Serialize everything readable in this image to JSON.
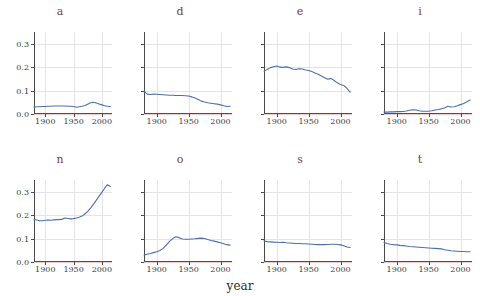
{
  "chart_data": {
    "type": "line",
    "title": "",
    "xlabel": "year",
    "ylabel": "",
    "xlim": [
      1880,
      2018
    ],
    "ylim": [
      0.0,
      0.35
    ],
    "grid": true,
    "legend": false,
    "legend_position": "none",
    "facet_layout": {
      "rows": 2,
      "cols": 4
    },
    "xticks": [
      1900,
      1950,
      2000
    ],
    "xtick_labels": [
      "1900",
      "1950",
      "2000"
    ],
    "yticks": [
      0.0,
      0.1,
      0.2,
      0.3
    ],
    "ytick_labels": [
      "0.0",
      "0.1",
      "0.2",
      "0.3"
    ],
    "line_color": "#4c6fad",
    "baseline_color": "#c0392b",
    "grid_color": "#e3e3ea",
    "title_color": "#7d3b45",
    "panels": [
      {
        "label": "a",
        "row": 0,
        "col": 0,
        "x": [
          1880,
          1885,
          1890,
          1895,
          1900,
          1905,
          1910,
          1915,
          1920,
          1925,
          1930,
          1935,
          1940,
          1945,
          1950,
          1955,
          1960,
          1965,
          1970,
          1975,
          1980,
          1985,
          1990,
          1995,
          2000,
          2005,
          2010,
          2015
        ],
        "y": [
          0.03,
          0.031,
          0.031,
          0.032,
          0.032,
          0.033,
          0.033,
          0.034,
          0.034,
          0.034,
          0.034,
          0.034,
          0.033,
          0.033,
          0.032,
          0.029,
          0.031,
          0.033,
          0.036,
          0.042,
          0.048,
          0.05,
          0.047,
          0.043,
          0.039,
          0.035,
          0.033,
          0.032
        ]
      },
      {
        "label": "d",
        "row": 0,
        "col": 1,
        "x": [
          1880,
          1885,
          1890,
          1895,
          1900,
          1905,
          1910,
          1915,
          1920,
          1925,
          1930,
          1935,
          1940,
          1945,
          1950,
          1955,
          1960,
          1965,
          1970,
          1975,
          1980,
          1985,
          1990,
          1995,
          2000,
          2005,
          2010,
          2015
        ],
        "y": [
          0.098,
          0.085,
          0.083,
          0.085,
          0.084,
          0.083,
          0.082,
          0.081,
          0.08,
          0.08,
          0.079,
          0.079,
          0.079,
          0.078,
          0.077,
          0.073,
          0.068,
          0.062,
          0.055,
          0.051,
          0.048,
          0.046,
          0.044,
          0.042,
          0.039,
          0.035,
          0.032,
          0.033
        ]
      },
      {
        "label": "e",
        "row": 0,
        "col": 2,
        "x": [
          1880,
          1885,
          1890,
          1895,
          1900,
          1905,
          1910,
          1915,
          1920,
          1925,
          1930,
          1935,
          1940,
          1945,
          1950,
          1955,
          1960,
          1965,
          1970,
          1975,
          1980,
          1985,
          1990,
          1995,
          2000,
          2005,
          2010,
          2015
        ],
        "y": [
          0.183,
          0.19,
          0.198,
          0.202,
          0.205,
          0.2,
          0.199,
          0.201,
          0.198,
          0.192,
          0.19,
          0.193,
          0.192,
          0.188,
          0.186,
          0.181,
          0.175,
          0.17,
          0.162,
          0.155,
          0.148,
          0.152,
          0.143,
          0.133,
          0.126,
          0.122,
          0.11,
          0.093
        ]
      },
      {
        "label": "i",
        "row": 0,
        "col": 3,
        "x": [
          1880,
          1885,
          1890,
          1895,
          1900,
          1905,
          1910,
          1915,
          1920,
          1925,
          1930,
          1935,
          1940,
          1945,
          1950,
          1955,
          1960,
          1965,
          1970,
          1975,
          1980,
          1985,
          1990,
          1995,
          2000,
          2005,
          2010,
          2015
        ],
        "y": [
          0.008,
          0.008,
          0.009,
          0.009,
          0.01,
          0.01,
          0.011,
          0.013,
          0.016,
          0.018,
          0.017,
          0.014,
          0.012,
          0.012,
          0.012,
          0.014,
          0.017,
          0.019,
          0.022,
          0.026,
          0.033,
          0.03,
          0.031,
          0.035,
          0.04,
          0.045,
          0.052,
          0.06
        ]
      },
      {
        "label": "n",
        "row": 1,
        "col": 0,
        "x": [
          1880,
          1885,
          1890,
          1895,
          1900,
          1905,
          1910,
          1915,
          1920,
          1925,
          1930,
          1935,
          1940,
          1945,
          1950,
          1955,
          1960,
          1965,
          1970,
          1975,
          1980,
          1985,
          1990,
          1995,
          2000,
          2005,
          2010,
          2015
        ],
        "y": [
          0.181,
          0.179,
          0.176,
          0.176,
          0.178,
          0.179,
          0.178,
          0.18,
          0.181,
          0.181,
          0.183,
          0.188,
          0.186,
          0.184,
          0.185,
          0.188,
          0.191,
          0.196,
          0.205,
          0.216,
          0.23,
          0.246,
          0.263,
          0.28,
          0.297,
          0.315,
          0.33,
          0.322
        ]
      },
      {
        "label": "o",
        "row": 1,
        "col": 1,
        "x": [
          1880,
          1885,
          1890,
          1895,
          1900,
          1905,
          1910,
          1915,
          1920,
          1925,
          1930,
          1935,
          1940,
          1945,
          1950,
          1955,
          1960,
          1965,
          1970,
          1975,
          1980,
          1985,
          1990,
          1995,
          2000,
          2005,
          2010,
          2015
        ],
        "y": [
          0.03,
          0.033,
          0.036,
          0.04,
          0.044,
          0.049,
          0.058,
          0.072,
          0.088,
          0.1,
          0.108,
          0.104,
          0.098,
          0.097,
          0.097,
          0.098,
          0.099,
          0.101,
          0.102,
          0.1,
          0.096,
          0.092,
          0.089,
          0.086,
          0.082,
          0.078,
          0.074,
          0.072
        ]
      },
      {
        "label": "s",
        "row": 1,
        "col": 2,
        "x": [
          1880,
          1885,
          1890,
          1895,
          1900,
          1905,
          1910,
          1915,
          1920,
          1925,
          1930,
          1935,
          1940,
          1945,
          1950,
          1955,
          1960,
          1965,
          1970,
          1975,
          1980,
          1985,
          1990,
          1995,
          2000,
          2005,
          2010,
          2015
        ],
        "y": [
          0.09,
          0.087,
          0.086,
          0.085,
          0.084,
          0.083,
          0.084,
          0.082,
          0.081,
          0.08,
          0.079,
          0.079,
          0.078,
          0.078,
          0.077,
          0.076,
          0.075,
          0.074,
          0.074,
          0.074,
          0.075,
          0.076,
          0.076,
          0.075,
          0.073,
          0.069,
          0.064,
          0.062
        ]
      },
      {
        "label": "t",
        "row": 1,
        "col": 3,
        "x": [
          1880,
          1885,
          1890,
          1895,
          1900,
          1905,
          1910,
          1915,
          1920,
          1925,
          1930,
          1935,
          1940,
          1945,
          1950,
          1955,
          1960,
          1965,
          1970,
          1975,
          1980,
          1985,
          1990,
          1995,
          2000,
          2005,
          2010,
          2015
        ],
        "y": [
          0.083,
          0.079,
          0.076,
          0.074,
          0.073,
          0.071,
          0.07,
          0.068,
          0.066,
          0.065,
          0.064,
          0.063,
          0.062,
          0.061,
          0.06,
          0.059,
          0.058,
          0.057,
          0.056,
          0.052,
          0.05,
          0.048,
          0.047,
          0.046,
          0.045,
          0.045,
          0.044,
          0.044
        ]
      }
    ]
  }
}
